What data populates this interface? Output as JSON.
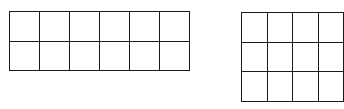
{
  "diagram": {
    "grids": [
      {
        "name": "left-grid",
        "rows": 2,
        "cols": 6,
        "x": 9,
        "y": 11,
        "cell_w": 29,
        "cell_h": 28.5
      },
      {
        "name": "right-grid",
        "rows": 3,
        "cols": 4,
        "x": 241,
        "y": 12,
        "cell_w": 28.5,
        "cell_h": 28.7,
        "clipped_right": true
      }
    ],
    "line_color": "#1a1a1a",
    "background": "#ffffff"
  }
}
